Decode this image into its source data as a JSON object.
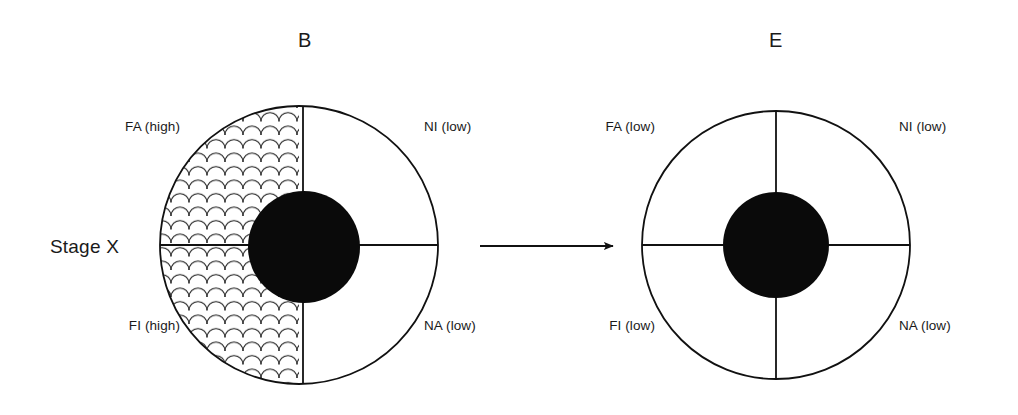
{
  "figure": {
    "type": "diagram",
    "background": "#ffffff",
    "stroke_color": "#000000",
    "fill_core": "#000000",
    "row_label": "Stage X",
    "arrow": {
      "name": "transition-arrow",
      "direction": "right",
      "x1": 480,
      "x2": 617,
      "y": 246
    },
    "panels": [
      {
        "id": "B",
        "title": "B",
        "title_x": 305,
        "title_y": 40,
        "center_x": 299,
        "center_y": 245,
        "outer_radius": 139,
        "core_radius": 56,
        "divider_x": 303,
        "hatched_quadrants": [
          "top-left",
          "bottom-left"
        ],
        "hatch_pattern": "fish-scale",
        "quadrants": [
          {
            "key": "FA",
            "position": "top-left",
            "label": "FA (high)",
            "level": "high",
            "label_x": 180,
            "label_y": 126
          },
          {
            "key": "NI",
            "position": "top-right",
            "label": "NI (low)",
            "level": "low",
            "label_x": 424,
            "label_y": 126
          },
          {
            "key": "FI",
            "position": "bottom-left",
            "label": "FI (high)",
            "level": "high",
            "label_x": 180,
            "label_y": 325
          },
          {
            "key": "NA",
            "position": "bottom-right",
            "label": "NA (low)",
            "level": "low",
            "label_x": 424,
            "label_y": 325
          }
        ]
      },
      {
        "id": "E",
        "title": "E",
        "title_x": 776,
        "title_y": 40,
        "center_x": 776,
        "center_y": 245,
        "outer_radius": 134,
        "core_radius": 53,
        "divider_x": 776,
        "hatched_quadrants": [],
        "hatch_pattern": "none",
        "quadrants": [
          {
            "key": "FA",
            "position": "top-left",
            "label": "FA (low)",
            "level": "low",
            "label_x": 655,
            "label_y": 126
          },
          {
            "key": "NI",
            "position": "top-right",
            "label": "NI (low)",
            "level": "low",
            "label_x": 899,
            "label_y": 126
          },
          {
            "key": "FI",
            "position": "bottom-left",
            "label": "FI (low)",
            "level": "low",
            "label_x": 655,
            "label_y": 325
          },
          {
            "key": "NA",
            "position": "bottom-right",
            "label": "NA (low)",
            "level": "low",
            "label_x": 899,
            "label_y": 325
          }
        ]
      }
    ],
    "stage_label_x": 50,
    "stage_label_y": 247
  }
}
